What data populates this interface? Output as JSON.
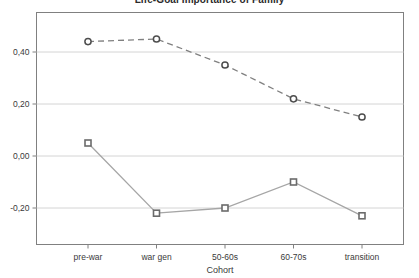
{
  "chart_data": {
    "type": "line",
    "title": "Life-Goal Importance of Family",
    "xlabel": "Cohort",
    "ylabel": "",
    "categories": [
      "pre-war",
      "war gen",
      "50-60s",
      "60-70s",
      "transition"
    ],
    "ytick_labels": [
      "0,40",
      "0,20",
      "0,00",
      "-0,20"
    ],
    "ytick_values": [
      0.4,
      0.2,
      0.0,
      -0.2
    ],
    "ylim": [
      -0.3,
      0.52
    ],
    "grid": true,
    "legend": "none",
    "series": [
      {
        "name": "series-1-dashed",
        "style": "dashed",
        "marker": "circle",
        "color": "#808080",
        "values": [
          0.44,
          0.45,
          0.35,
          0.22,
          0.15
        ]
      },
      {
        "name": "series-2-solid",
        "style": "solid",
        "marker": "square",
        "color": "#a6a6a6",
        "values": [
          0.05,
          -0.22,
          -0.2,
          -0.1,
          -0.23
        ]
      }
    ]
  },
  "colors": {
    "frame": "#808080",
    "gridline": "#d4d4d4",
    "axis_text": "#3a3a3a",
    "series_dashed": "#707070",
    "series_solid": "#a6a6a6",
    "marker_edge": "#4d4d4d",
    "marker_fill": "#ffffff",
    "background": "#ffffff"
  }
}
